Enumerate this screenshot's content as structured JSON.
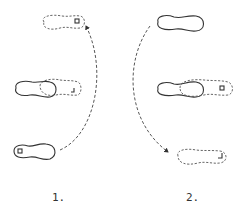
{
  "diagram": {
    "type": "footstep-pattern",
    "panels": [
      {
        "label": "1.",
        "steps": [
          {
            "position": "top",
            "style": "dashed",
            "mark": "R",
            "direction": "toe-left"
          },
          {
            "position": "middle",
            "style": "solid+dashed-overlap"
          },
          {
            "position": "bottom",
            "style": "solid",
            "mark": "R"
          }
        ],
        "arrow": "curved dashed from bottom foot up to top foot"
      },
      {
        "label": "2.",
        "steps": [
          {
            "position": "top",
            "style": "solid"
          },
          {
            "position": "middle",
            "style": "solid+dashed-overlap",
            "mark": "R"
          },
          {
            "position": "bottom",
            "style": "dashed",
            "mark": "L"
          }
        ],
        "arrow": "curved dashed from top foot down to bottom foot"
      }
    ],
    "colors": {
      "ink": "#333333",
      "background": "#ffffff"
    }
  }
}
